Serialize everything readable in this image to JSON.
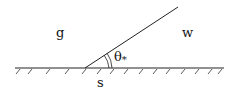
{
  "diagram": {
    "labels": {
      "gas": "g",
      "water": "w",
      "solid": "s",
      "angle": "θ",
      "angle_sub": "*"
    },
    "geometry": {
      "surface_y": 68,
      "surface_x_start": 15,
      "surface_x_end": 224,
      "contact_point": [
        85,
        68
      ],
      "interface_end": [
        178,
        7
      ]
    },
    "colors": {
      "stroke": "#222222",
      "background": "#ffffff"
    }
  }
}
